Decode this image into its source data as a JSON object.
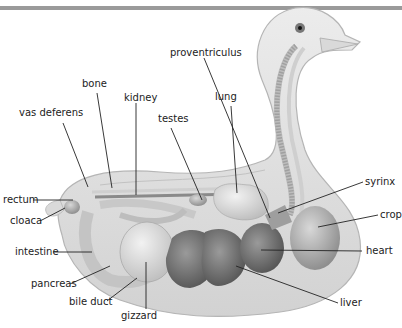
{
  "colors": {
    "background": "#ffffff",
    "body": "#e2e2e2",
    "body_outline": "#b5b5b5",
    "organ_dark": "#6f6f6f",
    "organ_mid": "#9c9c9c",
    "organ_light": "#c9c9c9",
    "leader_line": "#222222",
    "top_rule": "#9a9a9a"
  },
  "labels": {
    "proventriculus": "proventriculus",
    "bone": "bone",
    "kidney": "kidney",
    "lung": "lung",
    "vas_deferens": "vas deferens",
    "testes": "testes",
    "rectum": "rectum",
    "cloaca": "cloaca",
    "intestine": "intestine",
    "pancreas": "pancreas",
    "bile_duct": "bile duct",
    "gizzard": "gizzard",
    "syrinx": "syrinx",
    "crop": "crop",
    "heart": "heart",
    "liver": "liver"
  }
}
